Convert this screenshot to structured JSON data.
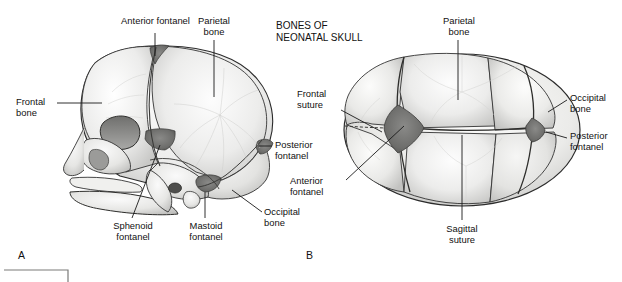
{
  "figure": {
    "title": "BONES OF\nNEONATAL SKULL",
    "background": "#ffffff",
    "bone_fill": "#ededec",
    "fontanel_fill": "#6d6d6d",
    "outline": "#2b2b2b",
    "leader_color": "#1a1a1a"
  },
  "panel_a": {
    "letter": "A",
    "view": "lateral view of neonatal skull",
    "labels": {
      "anterior_fontanel": "Anterior fontanel",
      "parietal_bone": "Parietal\nbone",
      "frontal_bone": "Frontal\nbone",
      "posterior_fontanel": "Posterior\nfontanel",
      "occipital_bone": "Occipital\nbone",
      "mastoid_fontanel": "Mastoid\nfontanel",
      "sphenoid_fontanel": "Sphenoid\nfontanel"
    }
  },
  "panel_b": {
    "letter": "B",
    "view": "superior view of neonatal skull",
    "labels": {
      "parietal_bone": "Parietal\nbone",
      "frontal_suture": "Frontal\nsuture",
      "occipital_bone": "Occipital\nbone",
      "posterior_fontanel": "Posterior\nfontanel",
      "anterior_fontanel": "Anterior\nfontanel",
      "sagittal_suture": "Sagittal\nsuture"
    }
  }
}
